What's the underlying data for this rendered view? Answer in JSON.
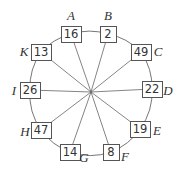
{
  "diagram": {
    "type": "circular-node-graph",
    "center_label": "",
    "nodes": [
      {
        "id": "A",
        "label": "A",
        "value": "16"
      },
      {
        "id": "B",
        "label": "B",
        "value": "2"
      },
      {
        "id": "C",
        "label": "C",
        "value": "49"
      },
      {
        "id": "D",
        "label": "D",
        "value": "22"
      },
      {
        "id": "E",
        "label": "E",
        "value": "19"
      },
      {
        "id": "F",
        "label": "F",
        "value": "8"
      },
      {
        "id": "G",
        "label": "G",
        "value": "14"
      },
      {
        "id": "H",
        "label": "H",
        "value": "47"
      },
      {
        "id": "I",
        "label": "I",
        "value": "26"
      },
      {
        "id": "K",
        "label": "K",
        "value": "13"
      }
    ],
    "edges_ring": [
      [
        "A",
        "B"
      ],
      [
        "B",
        "C"
      ],
      [
        "C",
        "D"
      ],
      [
        "D",
        "E"
      ],
      [
        "E",
        "F"
      ],
      [
        "F",
        "G"
      ],
      [
        "G",
        "H"
      ],
      [
        "H",
        "I"
      ],
      [
        "I",
        "K"
      ],
      [
        "K",
        "A"
      ]
    ],
    "edges_spoke": [
      "A",
      "B",
      "C",
      "D",
      "E",
      "F",
      "G",
      "H",
      "I",
      "K"
    ]
  }
}
